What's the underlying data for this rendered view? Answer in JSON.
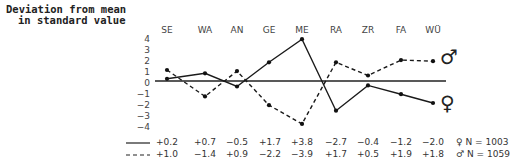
{
  "chart_data": {
    "type": "line",
    "title": "",
    "ylabel": "Deviation from mean in standard value",
    "ylabel_lines": [
      "Deviation from mean",
      "in standard value"
    ],
    "xlabel": "",
    "categories": [
      "SE",
      "WA",
      "AN",
      "GE",
      "ME",
      "RA",
      "ZR",
      "FA",
      "WÜ"
    ],
    "yticks": [
      "4",
      "3",
      "2",
      "1",
      "0",
      "−1",
      "−2",
      "−3",
      "−4"
    ],
    "ylim": [
      -4,
      4
    ],
    "grid": false,
    "zero_line": true,
    "series": [
      {
        "name": "♀ female",
        "style": "solid",
        "symbol": "♀",
        "n_label": "N = 1003",
        "values": [
          0.2,
          0.7,
          -0.5,
          1.7,
          3.8,
          -2.7,
          -0.4,
          -1.2,
          -2.0
        ],
        "labels": [
          "+0.2",
          "+0.7",
          "−0.5",
          "+1.7",
          "+3.8",
          "−2.7",
          "−0.4",
          "−1.2",
          "−2.0"
        ]
      },
      {
        "name": "♂ male",
        "style": "dashed",
        "symbol": "♂",
        "n_label": "N = 1059",
        "values": [
          1.0,
          -1.4,
          0.9,
          -2.2,
          -3.9,
          1.7,
          0.5,
          1.9,
          1.8
        ],
        "labels": [
          "+1.0",
          "−1.4",
          "+0.9",
          "−2.2",
          "−3.9",
          "+1.7",
          "+0.5",
          "+1.9",
          "+1.8"
        ]
      }
    ],
    "legend_position": "bottom-table"
  }
}
